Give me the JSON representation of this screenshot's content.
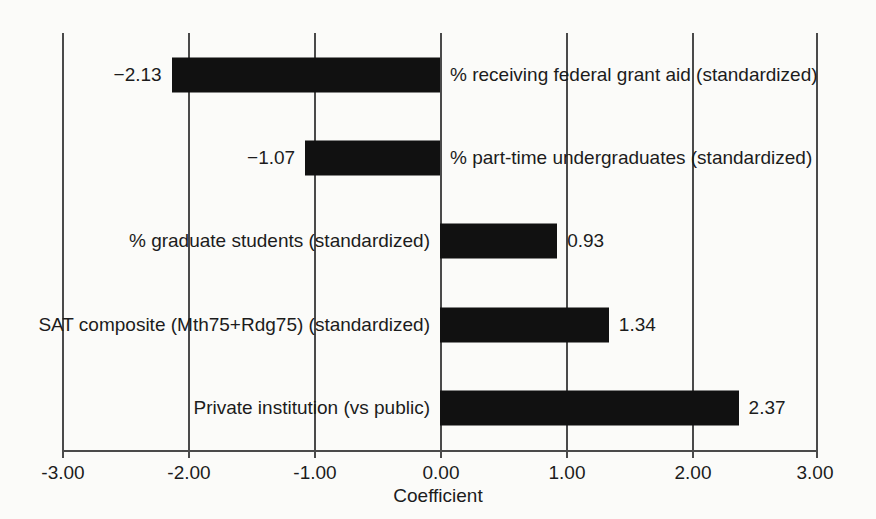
{
  "chart_data": {
    "type": "bar",
    "orientation": "horizontal",
    "title": "",
    "xlabel": "Coefficient",
    "ylabel": "",
    "xlim": [
      -3.0,
      3.0
    ],
    "xticks": [
      -3.0,
      -2.0,
      -1.0,
      0.0,
      1.0,
      2.0,
      3.0
    ],
    "xtick_labels": [
      "-3.00",
      "-2.00",
      "-1.00",
      "0.00",
      "1.00",
      "2.00",
      "3.00"
    ],
    "grid": true,
    "legend": null,
    "bar_color": "#111111",
    "categories": [
      "% receiving federal grant aid (standardized)",
      "% part-time undergraduates (standardized)",
      "% graduate students (standardized)",
      "SAT composite (Mth75+Rdg75) (standardized)",
      "Private institution (vs public)"
    ],
    "values": [
      -2.13,
      -1.07,
      0.93,
      1.34,
      2.37
    ],
    "value_labels": [
      "−2.13",
      "−1.07",
      "0.93",
      "1.34",
      "2.37"
    ],
    "bars": [
      {
        "label": "% receiving federal grant aid (standardized)",
        "value": -2.13,
        "value_label": "−2.13",
        "label_side": "right",
        "value_side": "left"
      },
      {
        "label": "% part-time undergraduates (standardized)",
        "value": -1.07,
        "value_label": "−1.07",
        "label_side": "right",
        "value_side": "left"
      },
      {
        "label": "% graduate students (standardized)",
        "value": 0.93,
        "value_label": "0.93",
        "label_side": "left",
        "value_side": "right"
      },
      {
        "label": "SAT composite (Mth75+Rdg75) (standardized)",
        "value": 1.34,
        "value_label": "1.34",
        "label_side": "left",
        "value_side": "right"
      },
      {
        "label": "Private institution (vs public)",
        "value": 2.37,
        "value_label": "2.37",
        "label_side": "left",
        "value_side": "right"
      }
    ]
  }
}
